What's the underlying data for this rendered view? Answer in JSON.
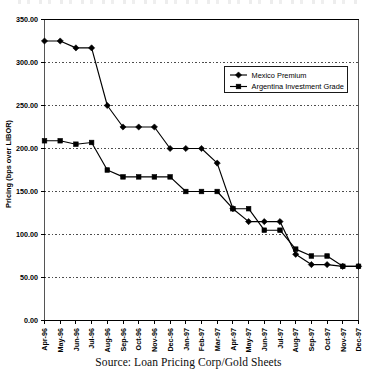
{
  "figure": {
    "source_note": "Source: Loan Pricing Corp/Gold Sheets"
  },
  "chart_data": {
    "type": "line",
    "title": "",
    "xlabel": "",
    "ylabel": "Pricing (bps over LIBOR)",
    "ylim": [
      0,
      350
    ],
    "ytick_labels": [
      "350.00",
      "300.00",
      "250.00",
      "200.00",
      "150.00",
      "100.00",
      "50.00",
      "0.00"
    ],
    "ytick_values": [
      350,
      300,
      250,
      200,
      150,
      100,
      50,
      0
    ],
    "grid": true,
    "grid_style": "dashed-horizontal",
    "legend_position": "upper-right-inside",
    "categories": [
      "Apr-96",
      "May-96",
      "Jun-96",
      "Jul-96",
      "Aug-96",
      "Sep-96",
      "Oct-96",
      "Nov-96",
      "Dec-96",
      "Jan-97",
      "Feb-97",
      "Mar-97",
      "Apr-97",
      "May-97",
      "Jun-97",
      "Jul-97",
      "Aug-97",
      "Sep-97",
      "Oct-97",
      "Nov-97",
      "Dec-97"
    ],
    "series": [
      {
        "name": "Mexico Premium",
        "marker": "diamond",
        "color": "#000000",
        "values": [
          325,
          325,
          317,
          317,
          250,
          225,
          225,
          225,
          200,
          200,
          200,
          183,
          130,
          115,
          115,
          115,
          77,
          65,
          65,
          63,
          63
        ]
      },
      {
        "name": "Argentina Investment Grade",
        "marker": "square",
        "color": "#000000",
        "values": [
          209,
          209,
          205,
          207,
          175,
          167,
          167,
          167,
          167,
          150,
          150,
          150,
          130,
          130,
          105,
          105,
          83,
          75,
          75,
          63,
          63
        ]
      }
    ]
  }
}
